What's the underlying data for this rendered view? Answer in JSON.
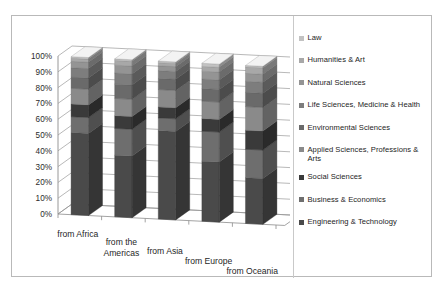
{
  "title_ghost": "",
  "chart_data": {
    "type": "bar",
    "subtype": "100% stacked column (3-D)",
    "title": "",
    "xlabel": "",
    "ylabel": "",
    "ylim": [
      0,
      100
    ],
    "ytick_labels": [
      "100%",
      "90%",
      "80%",
      "70%",
      "60%",
      "50%",
      "40%",
      "30%",
      "20%",
      "10%",
      "0%"
    ],
    "ytick_values": [
      100,
      90,
      80,
      70,
      60,
      50,
      40,
      30,
      20,
      10,
      0
    ],
    "grid": true,
    "legend_position": "right",
    "categories": [
      "from Africa",
      "from the Americas",
      "from Asia",
      "from Europe",
      "from Oceania"
    ],
    "series": [
      {
        "name": "Engineering & Technology",
        "color": "#4a4a4a",
        "values": [
          52,
          39,
          56,
          38,
          29
        ]
      },
      {
        "name": "Business & Economics",
        "color": "#6e6e6e",
        "values": [
          10,
          17,
          8,
          19,
          18
        ]
      },
      {
        "name": "Social Sciences",
        "color": "#3a3a3a",
        "values": [
          8,
          8,
          7,
          8,
          12
        ]
      },
      {
        "name": "Applied Sciences, Professions & Arts",
        "color": "#8a8a8a",
        "values": [
          10,
          11,
          11,
          11,
          15
        ]
      },
      {
        "name": "Environmental Sciences",
        "color": "#6a6a6a",
        "values": [
          7,
          9,
          7,
          8,
          9
        ]
      },
      {
        "name": "Life Sciences, Medicine & Health",
        "color": "#7d7d7d",
        "values": [
          6,
          7,
          5,
          6,
          7
        ]
      },
      {
        "name": "Natural Sciences",
        "color": "#949494",
        "values": [
          4,
          5,
          3,
          5,
          5
        ]
      },
      {
        "name": "Humanities & Art",
        "color": "#a8a8a8",
        "values": [
          2,
          3,
          2,
          3,
          4
        ]
      },
      {
        "name": "Law",
        "color": "#c2c2c2",
        "values": [
          1,
          1,
          1,
          2,
          1
        ]
      }
    ]
  },
  "legend": {
    "items": [
      {
        "label": "Law",
        "color": "#c2c2c2"
      },
      {
        "label": "Humanities & Art",
        "color": "#a8a8a8"
      },
      {
        "label": "Natural Sciences",
        "color": "#949494"
      },
      {
        "label": "Life Sciences, Medicine & Health",
        "color": "#7d7d7d"
      },
      {
        "label": "Environmental Sciences",
        "color": "#6a6a6a"
      },
      {
        "label": "Applied Sciences, Professions & Arts",
        "color": "#8a8a8a"
      },
      {
        "label": "Social Sciences",
        "color": "#3a3a3a"
      },
      {
        "label": "Business & Economics",
        "color": "#6e6e6e"
      },
      {
        "label": "Engineering & Technology",
        "color": "#4a4a4a"
      }
    ]
  },
  "colors": {
    "frame_border": "#b9b9b9",
    "gridline": "#9a9a9a",
    "axis": "#8c8c8c",
    "floor": "#ffffff",
    "background": "#ffffff"
  }
}
